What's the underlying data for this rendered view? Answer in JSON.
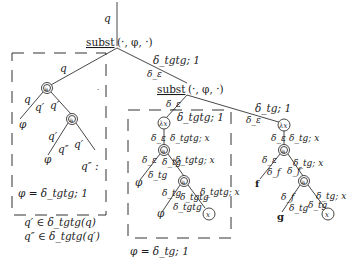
{
  "diagram": {
    "root_state": "q",
    "root_op": {
      "name": "subst",
      "args": "(·, φ, ·)"
    },
    "root_edges": {
      "right_top": "δ_tgtg; 1",
      "right_bottom": "δ_ε"
    },
    "left_box": {
      "edge_in": "q",
      "node1": "a",
      "edge_left_outer": "q",
      "edge_left_inner": "q′",
      "edge_right": "q′",
      "leaf_left": "φ",
      "node2": "a",
      "edge2_left_outer": "q′",
      "edge2_left_inner": "q″",
      "edge2_right": "q′",
      "leaf2_left": "φ",
      "leaf2_right": "q″ :",
      "caption": "φ = δ_tgtg; 1"
    },
    "legend": {
      "line1": "q′ ∈ δ_tgtg(q)",
      "line2": "q″ ∈ δ_tgtg(q′)"
    },
    "second_op": {
      "name": "subst",
      "args": "(·, φ, ·)",
      "edge_in_below": "δ_ε",
      "edge_right_top": "δ_tg; 1",
      "edge_right_bottom": "δ_ε"
    },
    "middle_box": {
      "edge_in_top": "δ_ε",
      "edge_in_right": "δ_tgtg; 1",
      "lambda_node": "λx",
      "edge_l1_left": "δ_ε",
      "edge_l1_right": "δ_tgtg; x",
      "node1": "a",
      "edge_n1_left": "δ_ε",
      "edge_n1_mid": "δ_tg",
      "edge_n1_right": "δ_tgtg; x",
      "edge_n1_left_inner": "δ_tg",
      "leaf1": "φ",
      "node2": "a",
      "edge_n2_left": "δ_tg",
      "edge_n2_mid": "δ_tgtg",
      "edge_n2_left_inner": "δ_tgtg",
      "edge_n2_right": "δ_tgtg; x",
      "leaf2": "φ",
      "var_leaf": "x",
      "caption": "φ = δ_tg; 1"
    },
    "right_tree": {
      "lambda_node": "λx",
      "edge_l_left": "δ_ε",
      "edge_l_right": "δ_tg; x",
      "node1": "a",
      "edge_n1_left": "δ_ε",
      "edge_n1_left_inner": "δ_f",
      "edge_n1_right": "δ_tg; x",
      "edge_n1_right_inner": "δ_f",
      "leaf_f": "f",
      "node2": "a",
      "edge_n2_left": "δ_f",
      "edge_n2_left_inner": "δ_tg",
      "edge_n2_right": "δ_tg; x",
      "edge_n2_right_inner": "δ_tg",
      "leaf_g": "g",
      "var_leaf": "x"
    }
  }
}
